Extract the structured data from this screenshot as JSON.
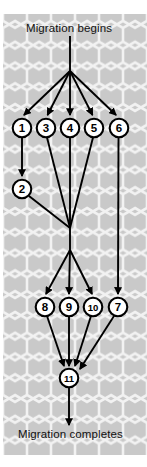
{
  "figure": {
    "type": "flow-diagram",
    "title_top": "Migration begins",
    "title_bottom": "Migration completes",
    "background": "#c9c9c9",
    "hex_line_color": "#f0f0f0",
    "node_fill": "#ffffff",
    "node_stroke": "#000000",
    "edge_color": "#000000"
  },
  "nodes": [
    {
      "id": "n1",
      "label": "1",
      "x": 22,
      "y": 128,
      "r": 9.5
    },
    {
      "id": "n3",
      "label": "3",
      "x": 46,
      "y": 128,
      "r": 9.5
    },
    {
      "id": "n4",
      "label": "4",
      "x": 70,
      "y": 128,
      "r": 9.5
    },
    {
      "id": "n5",
      "label": "5",
      "x": 94,
      "y": 128,
      "r": 9.5
    },
    {
      "id": "n6",
      "label": "6",
      "x": 119,
      "y": 128,
      "r": 9.5
    },
    {
      "id": "n2",
      "label": "2",
      "x": 22,
      "y": 189,
      "r": 9.5
    },
    {
      "id": "n8",
      "label": "8",
      "x": 45,
      "y": 307,
      "r": 9.5
    },
    {
      "id": "n9",
      "label": "9",
      "x": 69,
      "y": 307,
      "r": 9.5
    },
    {
      "id": "n10",
      "label": "10",
      "x": 93,
      "y": 307,
      "r": 9.5
    },
    {
      "id": "n7",
      "label": "7",
      "x": 118,
      "y": 307,
      "r": 9.5
    },
    {
      "id": "n11",
      "label": "11",
      "x": 69,
      "y": 378,
      "r": 9.5
    }
  ],
  "hub_points": [
    {
      "id": "hub-top",
      "x": 70,
      "y": 71
    },
    {
      "id": "hub-middle",
      "x": 70,
      "y": 228
    },
    {
      "id": "hub-lower",
      "x": 70,
      "y": 250
    }
  ],
  "edges": [
    {
      "from": "Migration begins",
      "to": "hub-top",
      "arrow": false
    },
    {
      "from": "hub-top",
      "to": "1",
      "arrow": true
    },
    {
      "from": "hub-top",
      "to": "3",
      "arrow": true
    },
    {
      "from": "hub-top",
      "to": "4",
      "arrow": true
    },
    {
      "from": "hub-top",
      "to": "5",
      "arrow": true
    },
    {
      "from": "hub-top",
      "to": "6",
      "arrow": true
    },
    {
      "from": "1",
      "to": "2",
      "arrow": true
    },
    {
      "from": "2",
      "to": "hub-middle",
      "arrow": false
    },
    {
      "from": "3",
      "to": "hub-middle",
      "arrow": false
    },
    {
      "from": "4",
      "to": "hub-middle",
      "arrow": false
    },
    {
      "from": "5",
      "to": "hub-middle",
      "arrow": false
    },
    {
      "from": "hub-lower",
      "to": "8",
      "arrow": true
    },
    {
      "from": "hub-lower",
      "to": "9",
      "arrow": true
    },
    {
      "from": "hub-lower",
      "to": "10",
      "arrow": true
    },
    {
      "from": "6",
      "to": "7",
      "arrow": true
    },
    {
      "from": "8",
      "to": "11",
      "arrow": true
    },
    {
      "from": "9",
      "to": "11",
      "arrow": true
    },
    {
      "from": "10",
      "to": "11",
      "arrow": true
    },
    {
      "from": "7",
      "to": "11",
      "arrow": true
    },
    {
      "from": "11",
      "to": "Migration completes",
      "arrow": true
    }
  ]
}
